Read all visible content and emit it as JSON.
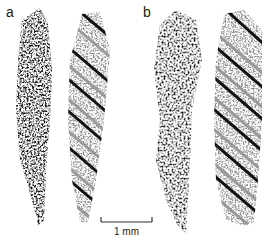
{
  "figure": {
    "panels": [
      {
        "label": "a",
        "columns": [
          {
            "kind": "point-cloud",
            "color": "#111111"
          },
          {
            "kind": "point-cloud-with-helix-stripes",
            "speckle_color": "#8a8a8a",
            "stripe_colors": [
              "#111111",
              "#9a9a9a"
            ]
          }
        ]
      },
      {
        "label": "b",
        "columns": [
          {
            "kind": "point-cloud",
            "color": "#111111"
          },
          {
            "kind": "point-cloud-with-helix-stripes",
            "speckle_color": "#8a8a8a",
            "stripe_colors": [
              "#111111",
              "#9a9a9a"
            ]
          }
        ]
      }
    ],
    "scale_bar": {
      "label": "1 mm",
      "color": "#333333"
    }
  }
}
